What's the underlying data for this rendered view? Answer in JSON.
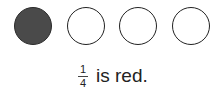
{
  "circles": [
    {
      "filled": true
    },
    {
      "filled": false
    },
    {
      "filled": false
    },
    {
      "filled": false
    }
  ],
  "caption": {
    "numerator": "1",
    "denominator": "4",
    "text": "is red."
  },
  "colors": {
    "filled": "#4a4a4a",
    "outline": "#222222"
  }
}
